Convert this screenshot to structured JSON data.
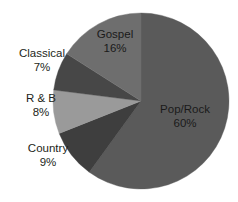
{
  "chart_data": {
    "type": "pie",
    "title": "",
    "subtitle": "",
    "xlabel": "",
    "ylabel": "",
    "legend": "none",
    "grid": false,
    "start_angle_deg": 0,
    "direction": "clockwise",
    "categories": [
      "Pop/Rock",
      "Country",
      "R & B",
      "Classical",
      "Gospel"
    ],
    "values": [
      60,
      9,
      8,
      7,
      16
    ],
    "unit": "%",
    "slices": [
      {
        "label": "Pop/Rock",
        "value": 60,
        "value_text": "60%",
        "color": "#5a5a5a",
        "start_deg": 0,
        "end_deg": 216
      },
      {
        "label": "Country",
        "value": 9,
        "value_text": "9%",
        "color": "#3e3e3e",
        "start_deg": 216,
        "end_deg": 248.4
      },
      {
        "label": "R & B",
        "value": 8,
        "value_text": "8%",
        "color": "#9a9a9a",
        "start_deg": 248.4,
        "end_deg": 277.2
      },
      {
        "label": "Classical",
        "value": 7,
        "value_text": "7%",
        "color": "#474747",
        "start_deg": 277.2,
        "end_deg": 302.4
      },
      {
        "label": "Gospel",
        "value": 16,
        "value_text": "16%",
        "color": "#6e6e6e",
        "start_deg": 302.4,
        "end_deg": 360
      }
    ]
  },
  "labels": {
    "gospel": {
      "name": "Gospel",
      "pct": "16%"
    },
    "classical": {
      "name": "Classical",
      "pct": "7%"
    },
    "rnb": {
      "name": "R & B",
      "pct": "8%"
    },
    "country": {
      "name": "Country",
      "pct": "9%"
    },
    "poprock": {
      "name": "Pop/Rock",
      "pct": "60%"
    }
  },
  "colors": {
    "background": "#ffffff",
    "text": "#231f20",
    "pop_rock": "#5a5a5a",
    "country": "#3e3e3e",
    "rnb": "#9a9a9a",
    "classical": "#474747",
    "gospel": "#6e6e6e"
  }
}
